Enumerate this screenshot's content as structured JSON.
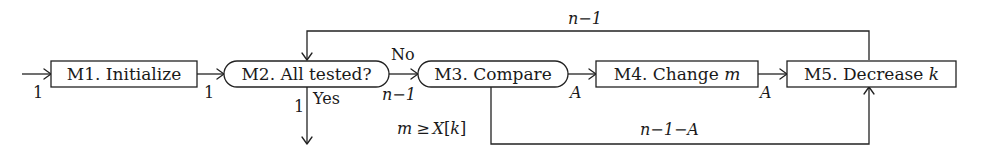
{
  "diagram": {
    "type": "flowchart",
    "nodes": [
      {
        "id": "M1",
        "label": "M1. Initialize",
        "shape": "rectangle"
      },
      {
        "id": "M2",
        "label": "M2. All tested?",
        "shape": "rounded"
      },
      {
        "id": "M3",
        "label": "M3. Compare",
        "shape": "rounded"
      },
      {
        "id": "M4",
        "label": "M4. Change ",
        "label_var": "m",
        "shape": "rectangle"
      },
      {
        "id": "M5",
        "label": "M5. Decrease ",
        "label_var": "k",
        "shape": "rectangle"
      }
    ],
    "edges": [
      {
        "from": "start",
        "to": "M1",
        "count": "1"
      },
      {
        "from": "M1",
        "to": "M2",
        "count": "1"
      },
      {
        "from": "M2",
        "to": "M3",
        "condition": "No",
        "count": "n−1"
      },
      {
        "from": "M2",
        "to": "exit",
        "condition": "Yes",
        "count": "1"
      },
      {
        "from": "M3",
        "to": "M4",
        "count": "A"
      },
      {
        "from": "M3",
        "to": "M5",
        "condition": "m ≥ X[k]",
        "count": "n−1−A"
      },
      {
        "from": "M4",
        "to": "M5",
        "count": "A"
      },
      {
        "from": "M5",
        "to": "M2",
        "count": "n−1"
      }
    ],
    "labels": {
      "start_count": "1",
      "m1_m2_count": "1",
      "no": "No",
      "m2_m3_count": "n−1",
      "yes": "Yes",
      "yes_count": "1",
      "m3_m4_count": "A",
      "m4_m5_count": "A",
      "loop_count": "n−1",
      "cond_m": "m",
      "cond_ge": "≥",
      "cond_X": "X",
      "cond_bracket_open": "[",
      "cond_k": "k",
      "cond_bracket_close": "]",
      "bypass_count": "n−1−A"
    }
  }
}
